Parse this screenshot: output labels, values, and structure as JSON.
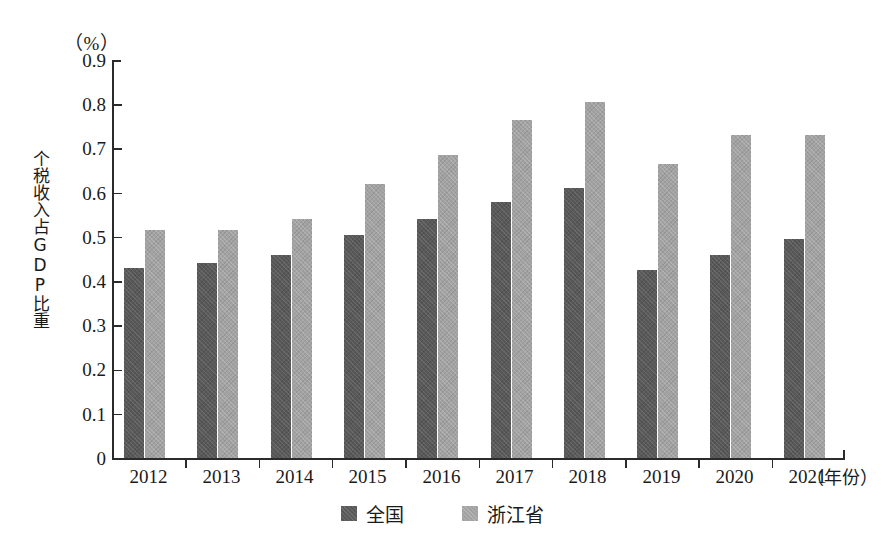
{
  "chart_data": {
    "type": "bar",
    "title": "",
    "subtitle": "",
    "unit_label": "（%）",
    "xlabel": "（年份）",
    "ylabel": "个税收入占GDP比重",
    "categories": [
      "2012",
      "2013",
      "2014",
      "2015",
      "2016",
      "2017",
      "2018",
      "2019",
      "2020",
      "2021"
    ],
    "series": [
      {
        "name": "全国",
        "color": "#595959",
        "values": [
          0.43,
          0.44,
          0.46,
          0.505,
          0.54,
          0.58,
          0.61,
          0.425,
          0.46,
          0.495
        ]
      },
      {
        "name": "浙江省",
        "color": "#a2a2a2",
        "values": [
          0.515,
          0.515,
          0.54,
          0.62,
          0.685,
          0.765,
          0.805,
          0.665,
          0.73,
          0.73
        ]
      }
    ],
    "ylim": [
      0,
      0.9
    ],
    "ytick_step": 0.1,
    "ytick_labels": [
      "0.9",
      "0.8",
      "0.7",
      "0.6",
      "0.5",
      "0.4",
      "0.3",
      "0.2",
      "0.1",
      "0"
    ],
    "grid": false,
    "legend_position": "bottom-center"
  },
  "legend": {
    "items": [
      {
        "label": "全国",
        "color": "#595959"
      },
      {
        "label": "浙江省",
        "color": "#a2a2a2"
      }
    ]
  }
}
